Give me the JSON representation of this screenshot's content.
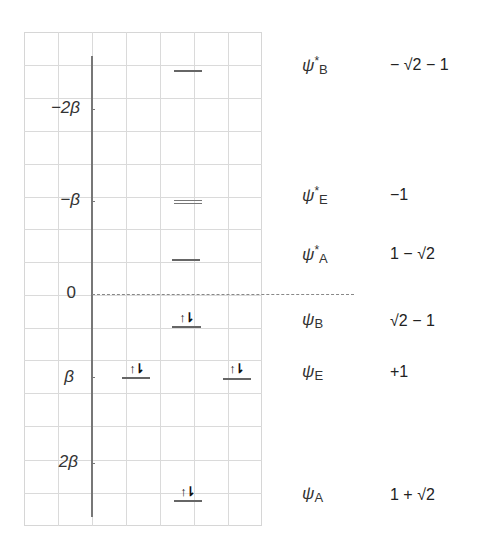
{
  "diagram": {
    "type": "huckel-mo-energy-diagram",
    "energy_axis": {
      "labels": [
        {
          "text": "−2β",
          "value": -2,
          "y": 109
        },
        {
          "text": "−β",
          "value": -1,
          "y": 201
        },
        {
          "text": "0",
          "value": 0,
          "y": 294
        },
        {
          "text": "β",
          "value": 1,
          "y": 377
        },
        {
          "text": "2β",
          "value": 2,
          "y": 463
        }
      ],
      "zero_reference": "dashed line at energy 0"
    },
    "levels": [
      {
        "id": "psi_star_B",
        "energy": "−√2 − 1",
        "occupied": false,
        "degenerate": false
      },
      {
        "id": "psi_star_E",
        "energy": "−1",
        "occupied": false,
        "degenerate": true
      },
      {
        "id": "psi_star_A",
        "energy": "1 − √2",
        "occupied": false,
        "degenerate": false
      },
      {
        "id": "psi_B",
        "energy": "√2 − 1",
        "occupied": true,
        "electrons": 2
      },
      {
        "id": "psi_E",
        "energy": "+1",
        "occupied": true,
        "degenerate": true,
        "electrons": 4
      },
      {
        "id": "psi_A",
        "energy": "1 + √2",
        "occupied": true,
        "electrons": 2
      }
    ],
    "electron_pair_glyph": "↑⇂",
    "orbital_labels": [
      {
        "psi": "ψ",
        "star": "*",
        "sub": "B",
        "energy": "− √2 − 1"
      },
      {
        "psi": "ψ",
        "star": "*",
        "sub": "E",
        "energy": "−1"
      },
      {
        "psi": "ψ",
        "star": "*",
        "sub": "A",
        "energy": "1 − √2"
      },
      {
        "psi": "ψ",
        "star": "",
        "sub": "B",
        "energy": "√2 − 1"
      },
      {
        "psi": "ψ",
        "star": "",
        "sub": "E",
        "energy": "+1"
      },
      {
        "psi": "ψ",
        "star": "",
        "sub": "A",
        "energy": "1 + √2"
      }
    ],
    "colors": {
      "grid": "#dadada",
      "axis": "#777777",
      "level": "#666666",
      "text": "#222222"
    }
  }
}
